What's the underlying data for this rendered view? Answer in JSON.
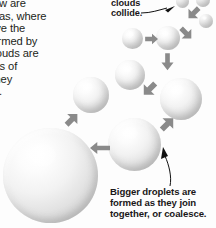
{
  "figure": {
    "type": "science-diagram",
    "background_color": "#fdfdfd",
    "text_color": "#231f20",
    "arrow_color": "#8a8a8a",
    "leader_color": "#111111",
    "droplet_color": "#e8e8e8"
  },
  "body": {
    "paragraph": "nd snow are\ncal areas, where\nly above the\nin is formed by\nThe clouds are\ndroplets of\nllide, they\nroplets."
  },
  "callouts": {
    "top": {
      "text": "clouds\ncollide.",
      "leader": "curve-to-arrowhead-right"
    },
    "bottom": {
      "text": "Bigger droplets are\nformed as they join\ntogether, or coalesce.",
      "leader": "curve-to-arrowhead-up"
    }
  },
  "droplets": [
    {
      "id": "droplet-tiny-1",
      "x": 176,
      "y": -5,
      "size": 13
    },
    {
      "id": "droplet-tiny-2",
      "x": 196,
      "y": -7,
      "size": 14
    },
    {
      "id": "droplet-tiny-3",
      "x": 199,
      "y": 14,
      "size": 14
    },
    {
      "id": "droplet-small-1",
      "x": 122,
      "y": 28,
      "size": 21
    },
    {
      "id": "droplet-small-2",
      "x": 156,
      "y": 26,
      "size": 24
    },
    {
      "id": "droplet-medium-1",
      "x": 115,
      "y": 60,
      "size": 30
    },
    {
      "id": "droplet-medium-2",
      "x": 73,
      "y": 77,
      "size": 36
    },
    {
      "id": "droplet-large-1",
      "x": 160,
      "y": 78,
      "size": 42
    },
    {
      "id": "droplet-large-2",
      "x": 108,
      "y": 118,
      "size": 53
    },
    {
      "id": "droplet-largest",
      "x": 3,
      "y": 128,
      "size": 95
    }
  ],
  "arrows": [
    {
      "id": "arrow-1",
      "direction": "down-right",
      "from": "droplet-tiny-1"
    },
    {
      "id": "arrow-2",
      "direction": "down-left",
      "from": "droplet-tiny-3"
    },
    {
      "id": "arrow-3",
      "direction": "right",
      "from": "droplet-small-1"
    },
    {
      "id": "arrow-4",
      "direction": "down",
      "from": "droplet-small-2"
    },
    {
      "id": "arrow-5",
      "direction": "down-right",
      "from": "droplet-medium-1"
    },
    {
      "id": "arrow-6",
      "direction": "down-left",
      "from": "droplet-large-1"
    },
    {
      "id": "arrow-7",
      "direction": "up-left",
      "from": "droplet-medium-2"
    },
    {
      "id": "arrow-8",
      "direction": "left",
      "from": "droplet-large-2"
    }
  ]
}
